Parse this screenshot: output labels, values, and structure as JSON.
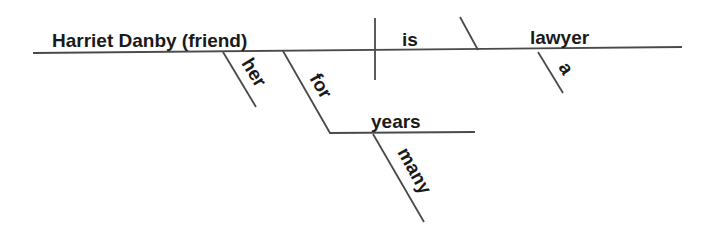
{
  "diagram": {
    "type": "sentence-diagram",
    "sentence_words": {
      "subject": "Harriet Danby (friend)",
      "verb": "is",
      "predicate_nominative": "lawyer",
      "subject_modifier_possessive": "her",
      "subject_modifier_preposition": "for",
      "preposition_object": "years",
      "object_modifier": "many",
      "predicate_article": "a"
    },
    "colors": {
      "line": "#4a4a4a",
      "text": "#1a1a1a",
      "background": "#ffffff"
    }
  }
}
